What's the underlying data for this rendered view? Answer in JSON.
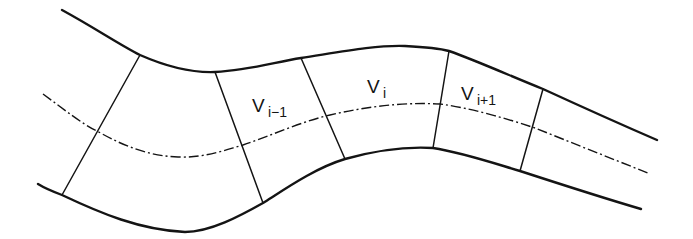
{
  "figure": {
    "stroke_color": "#141414",
    "background": "#ffffff",
    "labels": [
      {
        "id": "v_prev",
        "main": "V",
        "sub": "i−1"
      },
      {
        "id": "v_curr",
        "main": "V",
        "sub": "i"
      },
      {
        "id": "v_next",
        "main": "V",
        "sub": "i+1"
      }
    ],
    "walls": [
      "upper-boundary",
      "lower-boundary"
    ],
    "centerline": "dash-dot",
    "section_count": 5
  }
}
